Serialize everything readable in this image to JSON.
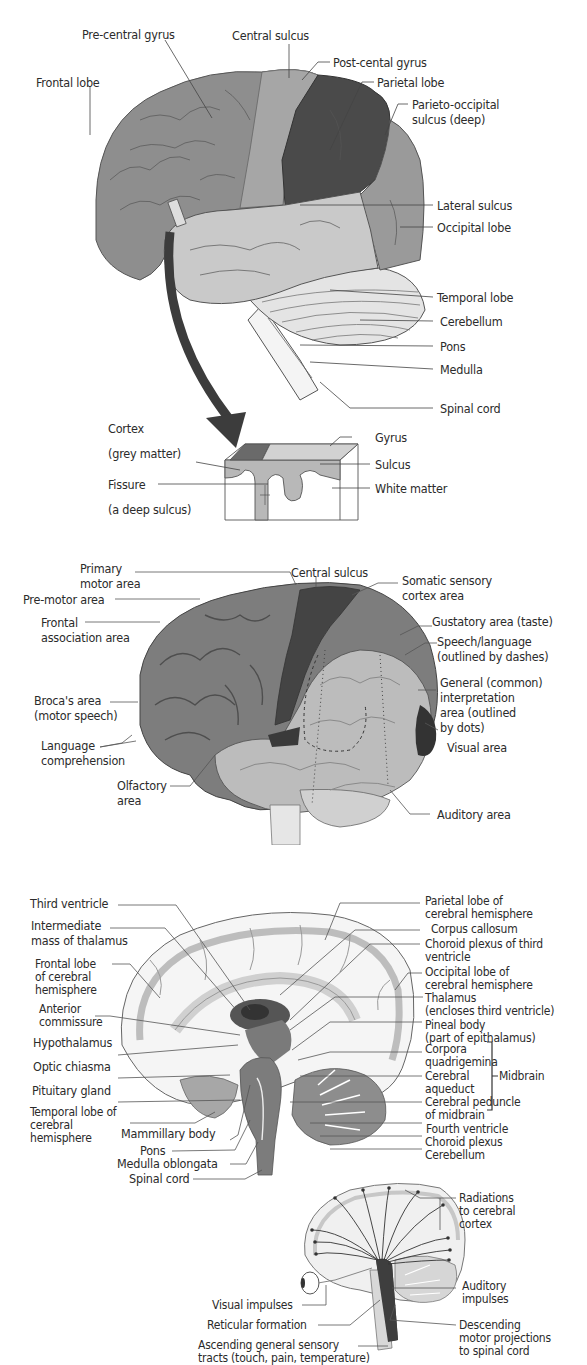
{
  "figure_1": {
    "title": "Lateral view of the brain: lobes and sulci",
    "labels": {
      "pre_central_gyrus": "Pre-central gyrus",
      "central_sulcus": "Central sulcus",
      "post_central_gyrus": "Post-cental gyrus",
      "frontal_lobe": "Frontal lobe",
      "parietal_lobe": "Parietal lobe",
      "parieto_occipital_1": "Parieto-occipital",
      "parieto_occipital_2": "sulcus (deep)",
      "lateral_sulcus": "Lateral sulcus",
      "occipital_lobe": "Occipital lobe",
      "temporal_lobe": "Temporal lobe",
      "cerebellum": "Cerebellum",
      "pons": "Pons",
      "medulla": "Medulla",
      "spinal_cord": "Spinal cord"
    },
    "inset": {
      "cortex_1": "Cortex",
      "cortex_2": "(grey matter)",
      "fissure_1": "Fissure",
      "fissure_2": "(a deep sulcus)",
      "gyrus": "Gyrus",
      "sulcus": "Sulcus",
      "white_matter": "White matter"
    },
    "colors": {
      "frontal": "#8e8e8e",
      "precentral": "#a6a6a6",
      "parietal": "#4a4a4a",
      "temporal": "#c9c9c9",
      "occipital": "#9a9a9a",
      "cerebellum": "#e4e4e4",
      "arrow": "#3c3c3c"
    }
  },
  "figure_2": {
    "title": "Functional areas of the cerebral cortex",
    "labels": {
      "primary_motor_1": "Primary",
      "primary_motor_2": "motor area",
      "central_sulcus": "Central sulcus",
      "somatic_1": "Somatic sensory",
      "somatic_2": "cortex area",
      "pre_motor": "Pre-motor area",
      "frontal_assoc_1": "Frontal",
      "frontal_assoc_2": "association area",
      "gustatory": "Gustatory area (taste)",
      "speech_1": "Speech/language",
      "speech_2": "(outlined by dashes)",
      "general_1": "General (common)",
      "general_2": "interpretation",
      "general_3": "area (outlined",
      "general_4": "by dots)",
      "broca_1": "Broca's area",
      "broca_2": "(motor speech)",
      "language_1": "Language",
      "language_2": "comprehension",
      "olfactory_1": "Olfactory",
      "olfactory_2": "area",
      "visual": "Visual area",
      "auditory": "Auditory area"
    }
  },
  "figure_3": {
    "title": "Midsagittal section of the brain",
    "left_labels": {
      "third_ventricle": "Third ventricle",
      "intermediate_1": "Intermediate",
      "intermediate_2": "mass of thalamus",
      "frontal_1": "Frontal lobe",
      "frontal_2": "of cerebral",
      "frontal_3": "hemisphere",
      "anterior_1": "Anterior",
      "anterior_2": "commissure",
      "hypothalamus": "Hypothalamus",
      "optic_chiasma": "Optic chiasma",
      "pituitary": "Pituitary gland",
      "temporal_1": "Temporal lobe of",
      "temporal_2": "cerebral",
      "temporal_3": "hemisphere",
      "mammillary": "Mammillary body",
      "pons": "Pons",
      "medulla": "Medulla oblongata",
      "spinal_cord": "Spinal cord"
    },
    "right_labels": {
      "parietal_1": "Parietal lobe of",
      "parietal_2": "cerebral hemisphere",
      "corpus_callosum": "Corpus callosum",
      "choroid_third_1": "Choroid plexus of third",
      "choroid_third_2": "ventricle",
      "occipital_1": "Occipital lobe of",
      "occipital_2": "cerebral hemisphere",
      "thalamus_1": "Thalamus",
      "thalamus_2": "(encloses third ventricle)",
      "pineal_1": "Pineal body",
      "pineal_2": "(part of epithalamus)",
      "corpora_1": "Corpora",
      "corpora_2": "quadrigemina",
      "aqueduct_1": "Cerebral",
      "aqueduct_2": "aqueduct",
      "midbrain": "Midbrain",
      "peduncle_1": "Cerebral peduncle",
      "peduncle_2": "of midbrain",
      "fourth_ventricle": "Fourth ventricle",
      "choroid_plexus": "Choroid plexus",
      "cerebellum": "Cerebellum"
    }
  },
  "figure_4": {
    "title": "Reticular activating system",
    "labels": {
      "radiations_1": "Radiations",
      "radiations_2": "to cerebral",
      "radiations_3": "cortex",
      "auditory_1": "Auditory",
      "auditory_2": "impulses",
      "visual": "Visual impulses",
      "reticular": "Reticular formation",
      "descending_1": "Descending",
      "descending_2": "motor projections",
      "descending_3": "to spinal cord",
      "ascending_1": "Ascending general sensory",
      "ascending_2": "tracts (touch, pain, temperature)"
    }
  }
}
